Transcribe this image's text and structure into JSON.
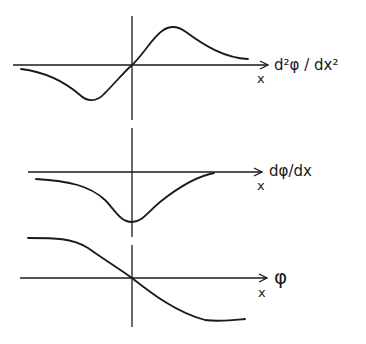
{
  "diagram": {
    "colors": {
      "ink": "#1a1a1a",
      "background": "#ffffff"
    },
    "vertical_axis": {
      "x": 132,
      "segments": [
        [
          16,
          120
        ],
        [
          128,
          237
        ],
        [
          245,
          327
        ]
      ]
    },
    "panels": [
      {
        "id": "second-derivative",
        "y_label": "d²φ / dx²",
        "x_label": "x",
        "axis_y": 65
      },
      {
        "id": "first-derivative",
        "y_label": "dφ/dx",
        "x_label": "x",
        "axis_y": 172
      },
      {
        "id": "potential",
        "y_label": "φ",
        "x_label": "x",
        "axis_y": 278
      }
    ]
  }
}
